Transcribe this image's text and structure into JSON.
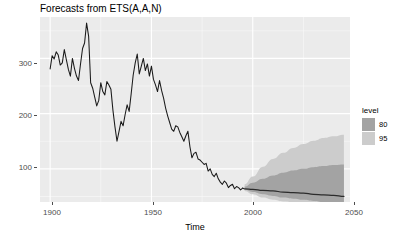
{
  "title": "Forecasts from ETS(A,A,N)",
  "axis": {
    "x_title": "Time",
    "y_title": "",
    "x_ticks": [
      "1900",
      "1950",
      "2000",
      "2050"
    ],
    "y_ticks": [
      "100",
      "200",
      "300"
    ]
  },
  "legend": {
    "title": "level",
    "items": [
      {
        "label": "80",
        "color": "#A3A3A3"
      },
      {
        "label": "95",
        "color": "#CCCCCC"
      }
    ]
  },
  "colors": {
    "panel_background": "#EBEBEB",
    "grid": "#FFFFFF",
    "series_line": "#1A1A1A",
    "forecast_line": "#2B2B2B",
    "interval_80": "#A3A3A3",
    "interval_95": "#CCCCCC",
    "axis_text": "#4D4D4D"
  },
  "chart_data": {
    "type": "line",
    "title": "Forecasts from ETS(A,A,N)",
    "xlabel": "Time",
    "ylabel": "",
    "xlim": [
      1895,
      2048
    ],
    "ylim": [
      40,
      375
    ],
    "grid": true,
    "legend_position": "right",
    "series": [
      {
        "name": "observed",
        "x": [
          1900,
          1901,
          1902,
          1903,
          1904,
          1905,
          1906,
          1907,
          1908,
          1909,
          1910,
          1911,
          1912,
          1913,
          1914,
          1915,
          1916,
          1917,
          1918,
          1919,
          1920,
          1921,
          1922,
          1923,
          1924,
          1925,
          1926,
          1927,
          1928,
          1929,
          1930,
          1931,
          1932,
          1933,
          1934,
          1935,
          1936,
          1937,
          1938,
          1939,
          1940,
          1941,
          1942,
          1943,
          1944,
          1945,
          1946,
          1947,
          1948,
          1949,
          1950,
          1951,
          1952,
          1953,
          1954,
          1955,
          1956,
          1957,
          1958,
          1959,
          1960,
          1961,
          1962,
          1963,
          1964,
          1965,
          1966,
          1967,
          1968,
          1969,
          1970,
          1971,
          1972,
          1973,
          1974,
          1975,
          1976,
          1977,
          1978,
          1979,
          1980,
          1981,
          1982,
          1983,
          1984,
          1985,
          1986,
          1987,
          1988,
          1989,
          1990,
          1991,
          1992,
          1993,
          1994,
          1995
        ],
        "y": [
          281,
          305,
          299,
          312,
          306,
          288,
          292,
          316,
          298,
          280,
          268,
          300,
          282,
          268,
          260,
          290,
          318,
          328,
          364,
          340,
          256,
          246,
          230,
          214,
          224,
          256,
          240,
          234,
          258,
          252,
          244,
          206,
          176,
          150,
          168,
          186,
          178,
          198,
          216,
          204,
          236,
          270,
          292,
          308,
          272,
          286,
          300,
          278,
          290,
          268,
          286,
          262,
          252,
          240,
          260,
          242,
          228,
          210,
          196,
          184,
          172,
          168,
          178,
          176,
          166,
          158,
          150,
          160,
          168,
          140,
          120,
          128,
          130,
          118,
          116,
          112,
          108,
          110,
          96,
          100,
          90,
          86,
          92,
          82,
          76,
          72,
          78,
          74,
          66,
          70,
          72,
          64,
          68,
          66,
          62,
          65
        ]
      },
      {
        "name": "point_forecast",
        "x": [
          1996,
          2000,
          2005,
          2010,
          2015,
          2020,
          2025,
          2030,
          2035,
          2040,
          2045
        ],
        "y": [
          64,
          63,
          61,
          60,
          58,
          57,
          56,
          54,
          53,
          52,
          50
        ]
      }
    ],
    "intervals": [
      {
        "level": 80,
        "x": [
          1996,
          2000,
          2005,
          2010,
          2015,
          2020,
          2025,
          2030,
          2035,
          2040,
          2045
        ],
        "lower": [
          62,
          58,
          54,
          51,
          48,
          46,
          44,
          42,
          40,
          40,
          40
        ],
        "upper": [
          68,
          75,
          82,
          88,
          93,
          97,
          100,
          103,
          105,
          107,
          108
        ]
      },
      {
        "level": 95,
        "x": [
          1996,
          2000,
          2005,
          2010,
          2015,
          2020,
          2025,
          2030,
          2035,
          2040,
          2045
        ],
        "lower": [
          60,
          54,
          48,
          44,
          41,
          40,
          40,
          40,
          40,
          40,
          40
        ],
        "upper": [
          72,
          86,
          104,
          118,
          129,
          138,
          145,
          151,
          156,
          159,
          162
        ]
      }
    ]
  }
}
